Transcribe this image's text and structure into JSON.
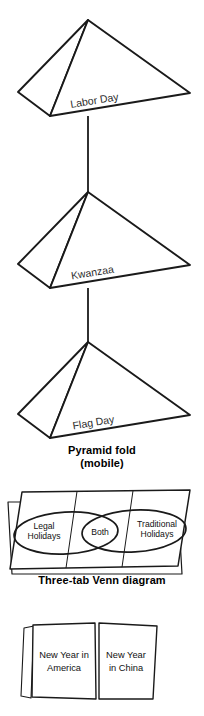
{
  "figures": {
    "pyramid_mobile": {
      "name": "Pyramid fold mobile",
      "pyramids": [
        {
          "label": "Labor Day"
        },
        {
          "label": "Kwanzaa"
        },
        {
          "label": "Flag Day"
        }
      ],
      "caption_line1": "Pyramid fold",
      "caption_line2": "(mobile)"
    },
    "venn": {
      "name": "Three-tab Venn diagram",
      "tabs": [
        {
          "label_line1": "Legal",
          "label_line2": "Holidays"
        },
        {
          "label_line1": "Both",
          "label_line2": ""
        },
        {
          "label_line1": "Traditional",
          "label_line2": "Holidays"
        }
      ],
      "caption": "Three-tab Venn diagram"
    },
    "two_panel": {
      "name": "Two panel fold",
      "panels": [
        {
          "label_line1": "New Year in",
          "label_line2": "America"
        },
        {
          "label_line1": "New Year",
          "label_line2": "in China"
        }
      ]
    }
  },
  "style": {
    "ink": "#1a1a1a",
    "paper": "#ffffff",
    "text": "#111111"
  }
}
